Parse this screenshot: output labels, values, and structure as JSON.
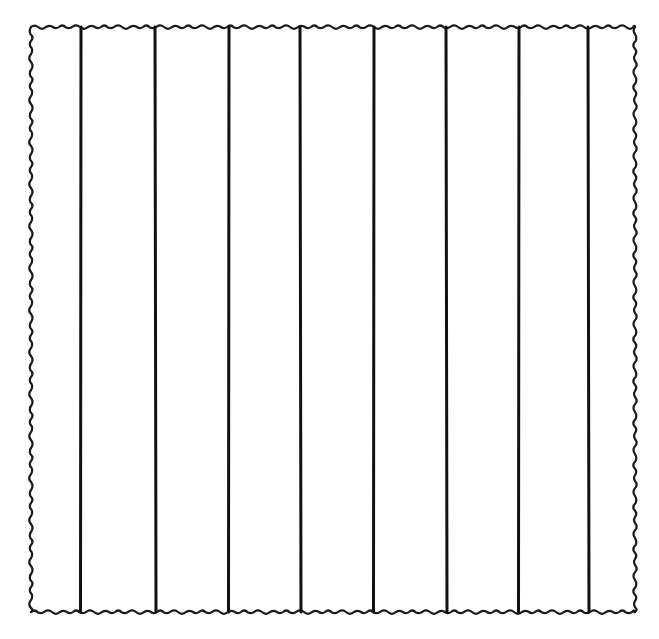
{
  "figure": {
    "strip_count": 9,
    "divider_count": 8,
    "line_color": "#111111",
    "background_color": "#ffffff",
    "border_style": "wavy"
  }
}
